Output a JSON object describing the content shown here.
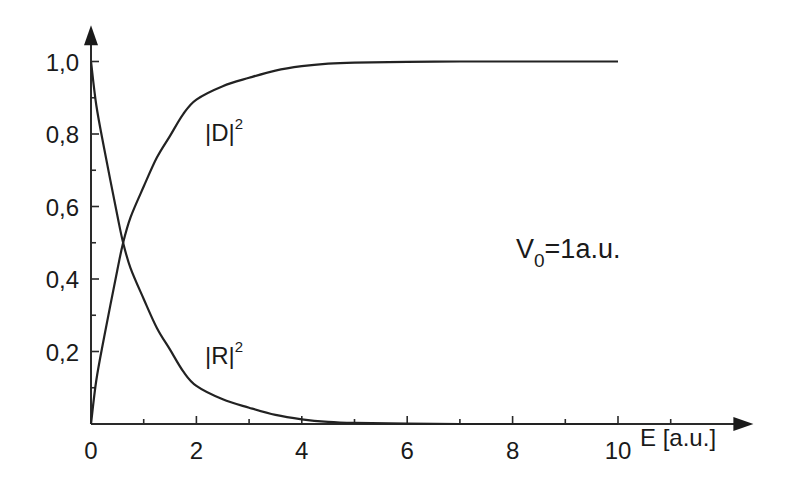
{
  "chart_data": {
    "type": "line",
    "title": "",
    "xlabel": "E [a.u.]",
    "ylabel": "",
    "xlim": [
      0,
      10
    ],
    "ylim": [
      0,
      1.0
    ],
    "x_axis_arrow_extent": 12,
    "y_axis_arrow_extent": 1.1,
    "grid": false,
    "x_major_ticks": [
      0,
      2,
      4,
      6,
      8,
      10
    ],
    "x_minor_ticks": [
      1,
      3,
      5,
      7,
      9,
      11
    ],
    "x_tick_labels": [
      "0",
      "2",
      "4",
      "6",
      "8",
      "10"
    ],
    "y_major_ticks": [
      0.2,
      0.4,
      0.6,
      0.8,
      1.0
    ],
    "y_minor_ticks": [
      0.1,
      0.3,
      0.5,
      0.7,
      0.9
    ],
    "y_tick_labels": [
      "0,2",
      "0,4",
      "0,6",
      "0,8",
      "1,0"
    ],
    "x": [
      0,
      0.1,
      0.25,
      0.5,
      0.61,
      0.75,
      1,
      1.25,
      1.5,
      1.75,
      2,
      2.5,
      3,
      3.5,
      4,
      4.5,
      5,
      6,
      7,
      8,
      9,
      10
    ],
    "series": [
      {
        "name": "|D|^2",
        "label_main": "|D|",
        "label_sup": "2",
        "values": [
          0,
          0.12,
          0.24,
          0.425,
          0.5,
          0.57,
          0.655,
          0.735,
          0.795,
          0.855,
          0.895,
          0.932,
          0.955,
          0.975,
          0.987,
          0.994,
          0.997,
          0.999,
          1.0,
          1.0,
          1.0,
          1.0
        ]
      },
      {
        "name": "|R|^2",
        "label_main": "|R|",
        "label_sup": "2",
        "values": [
          1.0,
          0.88,
          0.76,
          0.575,
          0.5,
          0.43,
          0.345,
          0.265,
          0.205,
          0.145,
          0.105,
          0.068,
          0.045,
          0.025,
          0.013,
          0.006,
          0.003,
          0.001,
          0,
          0,
          0,
          0
        ]
      }
    ],
    "annotations": [
      {
        "name": "potential-label",
        "main": "V",
        "sub": "0",
        "rest": "=1a.u."
      }
    ],
    "legend": "none (inline curve labels)"
  }
}
